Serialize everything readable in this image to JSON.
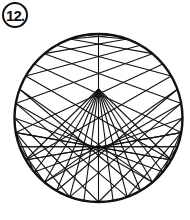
{
  "label": {
    "number": "12."
  },
  "figure": {
    "type": "string-art",
    "shape": "heart-envelope-in-circle",
    "circle": {
      "cx": 98.5,
      "cy": 118,
      "r": 84
    },
    "cusp": {
      "x": 98.5,
      "y": 89
    },
    "stroke": "#111111",
    "points": 36
  }
}
